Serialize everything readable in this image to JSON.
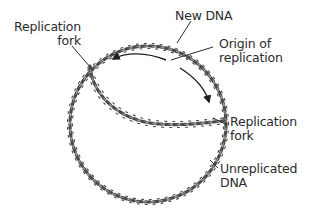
{
  "diagram": {
    "colors": {
      "strand": "#4a4a4a",
      "strand_highlight": "#9a9a9a",
      "label_text": "#2b2b2b",
      "leader_line": "#2b2b2b",
      "background": "#ffffff"
    },
    "labels": {
      "replication_fork_left": {
        "line1": "Replication",
        "line2": "fork"
      },
      "new_dna": {
        "line1": "New DNA"
      },
      "origin": {
        "line1": "Origin of",
        "line2": "replication"
      },
      "replication_fork_right": {
        "line1": "Replication",
        "line2": "fork"
      },
      "unreplicated_dna": {
        "line1": "Unreplicated",
        "line2": "DNA"
      }
    },
    "arrows": [
      {
        "name": "leftward-replication-arrow",
        "direction": "counterclockwise"
      },
      {
        "name": "rightward-replication-arrow",
        "direction": "clockwise"
      }
    ]
  }
}
